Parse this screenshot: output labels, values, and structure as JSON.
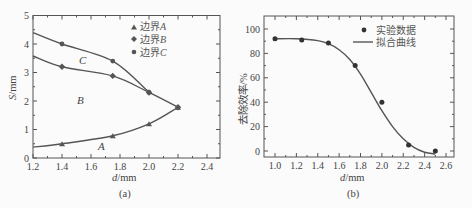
{
  "chart_data": [
    {
      "type": "line",
      "panel_label": "(a)",
      "xlabel": "d/mm",
      "ylabel": "S/mm",
      "xlim": [
        1.2,
        2.5
      ],
      "ylim": [
        0,
        5
      ],
      "xticks": [
        "1.2",
        "1.4",
        "1.6",
        "1.8",
        "2.0",
        "2.2",
        "2.4"
      ],
      "yticks": [
        "0",
        "1",
        "2",
        "3",
        "4",
        "5"
      ],
      "grid": false,
      "legend_position": "upper center",
      "series": [
        {
          "name": "边界A",
          "marker": "triangle",
          "x": [
            1.4,
            1.75,
            2.0,
            2.2
          ],
          "y": [
            0.5,
            0.78,
            1.2,
            1.78
          ],
          "curve_start": [
            1.2,
            0.38
          ]
        },
        {
          "name": "边界B",
          "marker": "diamond",
          "x": [
            1.4,
            1.75,
            2.0,
            2.2
          ],
          "y": [
            3.2,
            2.88,
            2.3,
            1.78
          ],
          "curve_start": [
            1.2,
            3.58
          ]
        },
        {
          "name": "边界C",
          "marker": "circle",
          "x": [
            1.4,
            1.75,
            2.0
          ],
          "y": [
            4.0,
            3.4,
            2.3
          ],
          "curve_start": [
            1.2,
            4.4
          ]
        }
      ],
      "annotations": [
        {
          "text": "A",
          "x": 1.67,
          "y": 0.28
        },
        {
          "text": "B",
          "x": 1.5,
          "y": 1.9
        },
        {
          "text": "C",
          "x": 1.55,
          "y": 3.4
        }
      ]
    },
    {
      "type": "scatter",
      "panel_label": "(b)",
      "xlabel": "d/mm",
      "ylabel": "去除效率/%",
      "xlim": [
        0.9,
        2.6
      ],
      "ylim": [
        -5,
        110
      ],
      "xticks": [
        "1.0",
        "1.2",
        "1.4",
        "1.6",
        "1.8",
        "2.0",
        "2.2",
        "2.4",
        "2.6"
      ],
      "yticks": [
        "0",
        "20",
        "40",
        "60",
        "80",
        "100"
      ],
      "grid": false,
      "legend_position": "upper right",
      "series": [
        {
          "name": "实验数据",
          "kind": "scatter",
          "x": [
            1.0,
            1.25,
            1.5,
            1.75,
            2.0,
            2.25,
            2.5
          ],
          "y": [
            92,
            91,
            88.5,
            70,
            40,
            5,
            0
          ]
        },
        {
          "name": "拟合曲线",
          "kind": "line",
          "x": [
            1.0,
            1.2,
            1.4,
            1.5,
            1.6,
            1.7,
            1.8,
            1.9,
            2.0,
            2.1,
            2.2,
            2.3,
            2.4,
            2.5
          ],
          "y": [
            92,
            92,
            90.5,
            88,
            83,
            75,
            63,
            48,
            33,
            20,
            10,
            3,
            -1,
            -2.5
          ]
        }
      ]
    }
  ],
  "labels": {
    "a_xlabel_italic": "d",
    "a_xlabel_unit": "/mm",
    "a_ylabel_italic": "S",
    "a_ylabel_unit": "/mm",
    "a_caption": "(a)",
    "b_xlabel_italic": "d",
    "b_xlabel_unit": "/mm",
    "b_ylabel": "去除效率/%",
    "b_caption": "(b)",
    "leg_a0": "边界",
    "leg_a0_i": "A",
    "leg_a1": "边界",
    "leg_a1_i": "B",
    "leg_a2": "边界",
    "leg_a2_i": "C",
    "leg_b0": "实验数据",
    "leg_b1": "拟合曲线",
    "region_A": "A",
    "region_B": "B",
    "region_C": "C"
  }
}
